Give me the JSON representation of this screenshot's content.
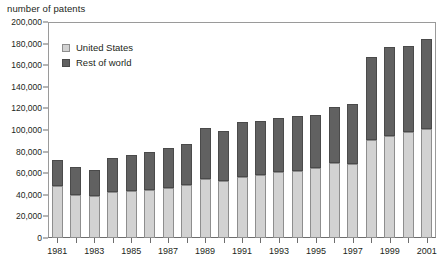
{
  "chart_data": {
    "type": "bar",
    "subtype": "stacked-vertical",
    "title": "number of patents",
    "xlabel": "",
    "ylabel": "",
    "ylim": [
      0,
      200000
    ],
    "ytick_step": 20000,
    "ytick_labels": [
      "200,000",
      "180,000",
      "160,000",
      "140,000",
      "120,000",
      "100,000",
      "80,000",
      "60,000",
      "40,000",
      "20,000",
      "0"
    ],
    "ytick_values": [
      200000,
      180000,
      160000,
      140000,
      120000,
      100000,
      80000,
      60000,
      40000,
      20000,
      0
    ],
    "grid": false,
    "legend_position": "inside-top-left",
    "categories": [
      "1981",
      "1982",
      "1983",
      "1984",
      "1985",
      "1986",
      "1987",
      "1988",
      "1989",
      "1990",
      "1991",
      "1992",
      "1993",
      "1994",
      "1995",
      "1996",
      "1997",
      "1998",
      "1999",
      "2000",
      "2001"
    ],
    "xtick_labels_shown": [
      "1981",
      "1983",
      "1985",
      "1987",
      "1989",
      "1991",
      "1993",
      "1995",
      "1997",
      "1999",
      "2001"
    ],
    "series": [
      {
        "name": "United States",
        "color": "#d2d2d2",
        "values": [
          48000,
          39500,
          38500,
          43000,
          43500,
          44500,
          46500,
          49500,
          54500,
          52500,
          56500,
          58000,
          61500,
          62000,
          65000,
          69000,
          68500,
          90500,
          94500,
          98500,
          100500
        ]
      },
      {
        "name": "Rest of world",
        "color": "#616161",
        "values": [
          24000,
          26000,
          24500,
          31500,
          33500,
          35000,
          36500,
          37500,
          47500,
          46500,
          50500,
          50500,
          49500,
          51000,
          48500,
          52000,
          55500,
          77000,
          82500,
          79500,
          84000
        ]
      }
    ],
    "totals": [
      72000,
      65500,
      63000,
      74500,
      77000,
      79500,
      83000,
      87000,
      102000,
      99000,
      107000,
      108500,
      111000,
      113000,
      113500,
      121000,
      124000,
      167500,
      177000,
      178000,
      184500
    ]
  },
  "legend": {
    "items": [
      {
        "label": "United States",
        "swatch": "light-gray-square-icon"
      },
      {
        "label": "Rest of world",
        "swatch": "dark-gray-square-icon"
      }
    ]
  }
}
